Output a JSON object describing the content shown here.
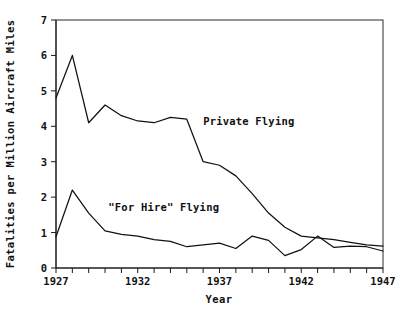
{
  "chart_data": {
    "type": "line",
    "title": "",
    "xlabel": "Year",
    "ylabel": "Fatalities per Million Aircraft Miles",
    "xlim": [
      1927,
      1947
    ],
    "ylim": [
      0,
      7
    ],
    "grid": false,
    "legend_position": "inline-annotations",
    "x": [
      1927,
      1928,
      1929,
      1930,
      1931,
      1932,
      1933,
      1934,
      1935,
      1936,
      1937,
      1938,
      1939,
      1940,
      1941,
      1942,
      1943,
      1944,
      1945,
      1946,
      1947
    ],
    "xticks": [
      1927,
      1932,
      1937,
      1942,
      1947
    ],
    "xticklabels": [
      "1927",
      "1932",
      "1937",
      "1942",
      "1947"
    ],
    "yticks": [
      0,
      1,
      2,
      3,
      4,
      5,
      6,
      7
    ],
    "yticklabels": [
      "0",
      "1",
      "2",
      "3",
      "4",
      "5",
      "6",
      "7"
    ],
    "series": [
      {
        "name": "Private Flying",
        "label": "Private Flying",
        "color": "#111111",
        "values": [
          4.8,
          6.0,
          4.1,
          4.6,
          4.3,
          4.15,
          4.1,
          4.25,
          4.2,
          3.0,
          2.9,
          2.6,
          2.1,
          1.55,
          1.15,
          0.9,
          0.85,
          0.8,
          0.72,
          0.65,
          0.62
        ]
      },
      {
        "name": "\"For Hire\" Flying",
        "label": "\"For Hire\" Flying",
        "color": "#111111",
        "values": [
          0.88,
          2.2,
          1.55,
          1.05,
          0.95,
          0.9,
          0.8,
          0.75,
          0.6,
          0.65,
          0.7,
          0.55,
          0.9,
          0.78,
          0.35,
          0.52,
          0.9,
          0.58,
          0.62,
          0.6,
          0.48
        ]
      }
    ],
    "annotations": [
      {
        "text": "Private Flying",
        "x": 1936,
        "y": 4.05
      },
      {
        "text": "\"For Hire\" Flying",
        "x": 1930.2,
        "y": 1.62
      }
    ]
  },
  "axis": {
    "y_title": "Fatalities per Million Aircraft Miles",
    "x_title": "Year"
  }
}
